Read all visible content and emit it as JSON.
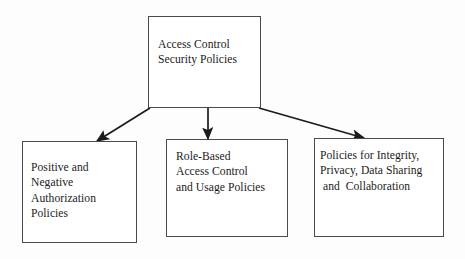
{
  "diagram": {
    "background_color": "#fdfdfd",
    "border_color": "#4a4a4a",
    "text_color": "#1b1b1b",
    "arrow_color": "#1b1b1b",
    "nodes": {
      "root": {
        "id": "access-control-security-policies",
        "text": "Access Control\nSecurity Policies",
        "lines": [
          "Access Control",
          "Security Policies"
        ]
      },
      "leaf_1": {
        "id": "positive-and-negative-authorization-policies",
        "text": "Positive and\nNegative\nAuthorization\nPolicies",
        "lines": [
          "Positive and",
          "Negative",
          "Authorization",
          "Policies"
        ]
      },
      "leaf_2": {
        "id": "role-based-access-control-and-usage-policies",
        "text": "Role-Based\nAccess Control\nand Usage Policies",
        "lines": [
          "Role-Based",
          "Access Control",
          "and Usage Policies"
        ]
      },
      "leaf_3": {
        "id": "policies-for-integrity-privacy-data-sharing-and-collaboration",
        "text": "Policies for Integrity,\nPrivacy, Data Sharing\n and  Collaboration",
        "lines": [
          "Policies for Integrity,",
          "Privacy, Data Sharing",
          " and  Collaboration"
        ]
      }
    },
    "connectors": [
      {
        "id": "arrow-root-to-leaf-1",
        "from": "root",
        "to": "leaf_1",
        "style": "diagonal-left"
      },
      {
        "id": "arrow-root-to-leaf-2",
        "from": "root",
        "to": "leaf_2",
        "style": "vertical"
      },
      {
        "id": "arrow-root-to-leaf-3",
        "from": "root",
        "to": "leaf_3",
        "style": "diagonal-right"
      }
    ]
  }
}
